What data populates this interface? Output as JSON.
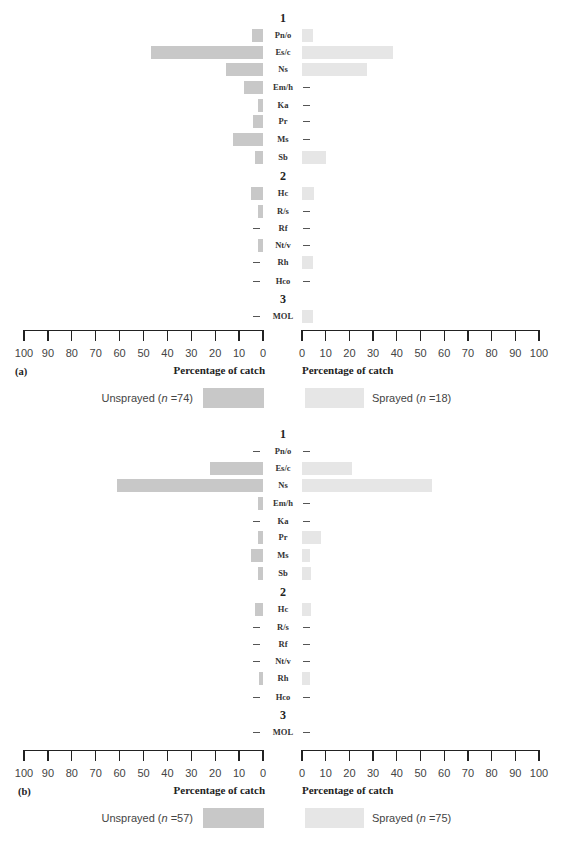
{
  "chart_data": [
    {
      "type": "bar",
      "orientation": "horizontal-butterfly",
      "panel_label": "(a)",
      "title": "",
      "xlabel_left": "Percentage of catch",
      "xlabel_right": "Percentage of catch",
      "xlim": [
        0,
        100
      ],
      "x_ticks_left": [
        "100",
        "90",
        "80",
        "70",
        "60",
        "50",
        "40",
        "30",
        "20",
        "10",
        "0"
      ],
      "x_ticks_right": [
        "0",
        "10",
        "20",
        "30",
        "40",
        "50",
        "60",
        "70",
        "80",
        "90",
        "100"
      ],
      "groups": [
        {
          "label": "1",
          "categories": [
            "Pn/o",
            "Es/c",
            "Ns",
            "Em/h",
            "Ka",
            "Pr",
            "Ms",
            "Sb"
          ]
        },
        {
          "label": "2",
          "categories": [
            "Hc",
            "R/s",
            "Rf",
            "Nt/v",
            "Rh",
            "Hco"
          ]
        },
        {
          "label": "3",
          "categories": [
            "MOL"
          ]
        }
      ],
      "categories": [
        "Pn/o",
        "Es/c",
        "Ns",
        "Em/h",
        "Ka",
        "Pr",
        "Ms",
        "Sb",
        "Hc",
        "R/s",
        "Rf",
        "Nt/v",
        "Rh",
        "Hco",
        "MOL"
      ],
      "series": [
        {
          "name": "Unsprayed (n =74)",
          "side": "left",
          "color": "#c8c8c8",
          "values": [
            4.5,
            47,
            15.5,
            8,
            2,
            4,
            12.5,
            3.5,
            5,
            2,
            0,
            2,
            0,
            0,
            0
          ]
        },
        {
          "name": "Sprayed (n =18)",
          "side": "right",
          "color": "#e6e6e6",
          "values": [
            4.5,
            38.5,
            27.5,
            0,
            0,
            0,
            0,
            10,
            5,
            0,
            0,
            0,
            4.5,
            0,
            4.5
          ]
        }
      ],
      "legend": {
        "left": {
          "prefix": "Unsprayed (",
          "n_italic": "n",
          "suffix": " =74)"
        },
        "right": {
          "prefix": "Sprayed (",
          "n_italic": "n",
          "suffix": " =18)"
        }
      }
    },
    {
      "type": "bar",
      "orientation": "horizontal-butterfly",
      "panel_label": "(b)",
      "title": "",
      "xlabel_left": "Percentage of catch",
      "xlabel_right": "Percentage of catch",
      "xlim": [
        0,
        100
      ],
      "x_ticks_left": [
        "100",
        "90",
        "80",
        "70",
        "60",
        "50",
        "40",
        "30",
        "20",
        "10",
        "0"
      ],
      "x_ticks_right": [
        "0",
        "10",
        "20",
        "30",
        "40",
        "50",
        "60",
        "70",
        "80",
        "90",
        "100"
      ],
      "groups": [
        {
          "label": "1",
          "categories": [
            "Pn/o",
            "Es/c",
            "Ns",
            "Em/h",
            "Ka",
            "Pr",
            "Ms",
            "Sb"
          ]
        },
        {
          "label": "2",
          "categories": [
            "Hc",
            "R/s",
            "Rf",
            "Nt/v",
            "Rh",
            "Hco"
          ]
        },
        {
          "label": "3",
          "categories": [
            "MOL"
          ]
        }
      ],
      "categories": [
        "Pn/o",
        "Es/c",
        "Ns",
        "Em/h",
        "Ka",
        "Pr",
        "Ms",
        "Sb",
        "Hc",
        "R/s",
        "Rf",
        "Nt/v",
        "Rh",
        "Hco",
        "MOL"
      ],
      "series": [
        {
          "name": "Unsprayed (n =57)",
          "side": "left",
          "color": "#c8c8c8",
          "values": [
            0,
            22,
            61,
            2,
            0,
            2,
            5,
            2,
            3.5,
            0,
            0,
            0,
            1.5,
            0,
            0
          ]
        },
        {
          "name": "Sprayed (n =75)",
          "side": "right",
          "color": "#e6e6e6",
          "values": [
            0,
            21,
            55,
            0,
            0,
            8,
            3.5,
            4,
            4,
            0,
            0,
            0,
            3.5,
            0,
            0
          ]
        }
      ],
      "legend": {
        "left": {
          "prefix": "Unsprayed (",
          "n_italic": "n",
          "suffix": " =57)"
        },
        "right": {
          "prefix": "Sprayed (",
          "n_italic": "n",
          "suffix": " =75)"
        }
      }
    }
  ]
}
